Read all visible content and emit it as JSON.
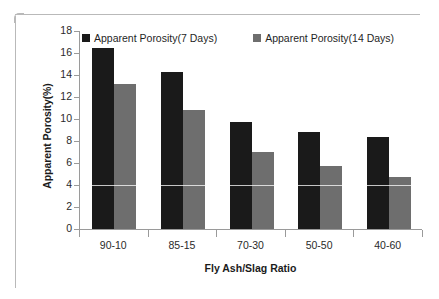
{
  "chart_data": {
    "type": "bar",
    "title": "",
    "xlabel": "Fly Ash/Slag Ratio",
    "ylabel": "Apparent Porosity(%)",
    "categories": [
      "90-10",
      "85-15",
      "70-30",
      "50-50",
      "40-60"
    ],
    "series": [
      {
        "name": "Apparent Porosity(7 Days)",
        "color": "#1a1a1a",
        "values": [
          16.5,
          14.3,
          9.7,
          8.8,
          8.35
        ]
      },
      {
        "name": "Apparent Porosity(14 Days)",
        "color": "#6e6e6e",
        "values": [
          13.2,
          10.8,
          7.0,
          5.7,
          4.75
        ]
      }
    ],
    "ylim": [
      0,
      18
    ],
    "y_ticks": [
      18,
      16,
      14,
      12,
      10,
      8,
      6,
      4,
      2,
      0
    ],
    "y_tick_labels": [
      "18",
      "16",
      "14",
      "12",
      "10",
      "8",
      "6",
      "4",
      "2",
      "0"
    ],
    "grid": false,
    "legend_position": "top-inside"
  }
}
